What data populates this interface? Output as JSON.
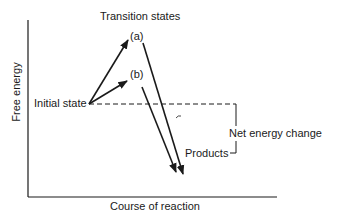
{
  "diagram": {
    "type": "energy-profile",
    "axes": {
      "y_label": "Free energy",
      "x_label": "Course of reaction"
    },
    "labels": {
      "transition_states": "Transition states",
      "path_a": "(a)",
      "path_b": "(b)",
      "initial_state": "Initial state",
      "products": "Products",
      "net_energy_change": "Net energy change"
    },
    "colors": {
      "line": "#1a1a1a",
      "background": "#ffffff"
    }
  }
}
